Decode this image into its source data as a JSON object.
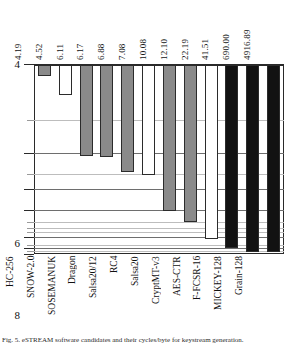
{
  "chart_data": {
    "type": "bar",
    "title": "",
    "xlabel": "",
    "ylabel": "",
    "categories": [
      "HC-256",
      "SNOW-2.0",
      "SOSEMANUK",
      "Dragon",
      "Salsa20/12",
      "RC4",
      "Salsa20",
      "CryptMT-v3",
      "AES-CTR",
      "F-FCSR-16",
      "MICKEY-128",
      "Grain-128"
    ],
    "values": [
      4.19,
      4.52,
      6.11,
      6.17,
      6.88,
      7.08,
      10.08,
      12.1,
      22.19,
      41.51,
      690.0,
      4916.89
    ],
    "value_labels": [
      "4.19",
      "4.52",
      "6.11",
      "6.17",
      "6.88",
      "7.08",
      "10.08",
      "12.10",
      "22.19",
      "41.51",
      "690.00",
      "4916.89"
    ],
    "bar_styles": [
      "gray",
      "white",
      "gray",
      "gray",
      "gray",
      "white",
      "gray",
      "gray",
      "white",
      "black",
      "black",
      "black"
    ],
    "axis_inverted": true,
    "yticks": [
      {
        "label": "4",
        "value": 4,
        "major": true
      },
      {
        "label": "",
        "value": 5,
        "major": false
      },
      {
        "label": "6",
        "value": 6,
        "major": true
      },
      {
        "label": "",
        "value": 7,
        "major": false
      },
      {
        "label": "8",
        "value": 8,
        "major": true
      },
      {
        "label": "10",
        "value": 10,
        "major": true
      },
      {
        "label": "",
        "value": 12,
        "major": false
      },
      {
        "label": "",
        "value": 14,
        "major": false
      },
      {
        "label": "",
        "value": 16,
        "major": false
      },
      {
        "label": "20",
        "value": 20,
        "major": true
      },
      {
        "label": "",
        "value": 30,
        "major": false
      },
      {
        "label": "40",
        "value": 40,
        "major": true
      },
      {
        "label": "",
        "value": 100,
        "major": false
      },
      {
        "label": "∞",
        "value": 1000000,
        "major": true
      }
    ],
    "ylim": [
      4,
      1000000
    ],
    "grid": true,
    "legend": null
  },
  "caption": {
    "text": "Fig. 5.  eSTREAM software candidates and their cycles/byte for keystream generation."
  }
}
